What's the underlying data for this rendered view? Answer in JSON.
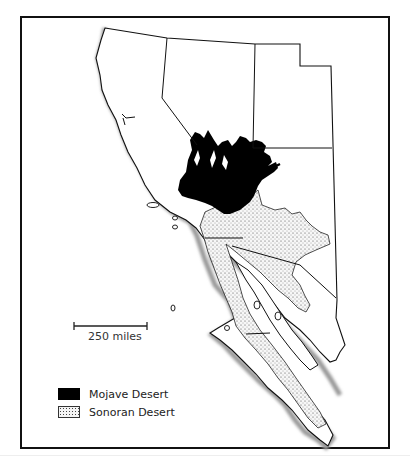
{
  "map": {
    "title": "",
    "scale_bar": {
      "label": "250 miles"
    },
    "legend": [
      {
        "label": "Mojave Desert",
        "fill": "#000000",
        "pattern": "solid"
      },
      {
        "label": "Sonoran Desert",
        "fill": "#f4f4f4",
        "pattern": "stipple"
      }
    ],
    "regions_depicted": [
      "Mojave Desert",
      "Sonoran Desert"
    ],
    "colors": {
      "border": "#111111",
      "land": "#ffffff",
      "mojave": "#000000",
      "sonoran_dots": "#444444",
      "coast_shadow": "#aaaaaa"
    }
  }
}
